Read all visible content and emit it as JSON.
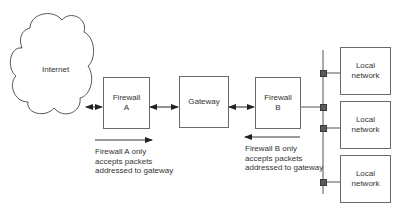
{
  "diagram": {
    "internet": {
      "label": "Internet"
    },
    "firewall_a": {
      "line1": "Firewall",
      "line2": "A"
    },
    "gateway": {
      "label": "Gateway"
    },
    "firewall_b": {
      "line1": "Firewall",
      "line2": "B"
    },
    "local_networks": [
      {
        "line1": "Local",
        "line2": "network"
      },
      {
        "line1": "Local",
        "line2": "network"
      },
      {
        "line1": "Local",
        "line2": "network"
      }
    ],
    "note_a": {
      "arrow_direction": "right",
      "lines": [
        "Firewall A only",
        "accepts packets",
        "addressed to gateway"
      ]
    },
    "note_b": {
      "arrow_direction": "left",
      "lines": [
        "Firewall B only",
        "accepts packets",
        "addressed to gateway"
      ]
    },
    "colors": {
      "line": "#4a4a4a",
      "box_border": "#6a6a6a",
      "connector": "#5a5a5a",
      "text": "#333333"
    }
  }
}
